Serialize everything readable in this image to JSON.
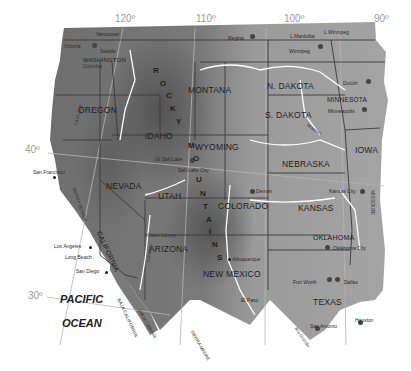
{
  "map": {
    "title": "Western United States relief map",
    "colors": {
      "land": "#8e8e8e",
      "relief_dark": "#555555",
      "water": "#ffffff",
      "border": "#3a3a3a",
      "graticule": "#b0b0b0"
    },
    "graticule": {
      "longitudes": [
        "120º",
        "110º",
        "100º",
        "90º"
      ],
      "latitudes": [
        "40º",
        "30º"
      ]
    },
    "states": {
      "washington": "WASHINGTON",
      "oregon": "OREGON",
      "idaho": "IDAHO",
      "montana": "MONTANA",
      "wyoming": "WYOMING",
      "n_dakota": "N. DAKOTA",
      "s_dakota": "S. DAKOTA",
      "minnesota": "MINNESOTA",
      "iowa": "IOWA",
      "nebraska": "NEBRASKA",
      "nevada": "NEVADA",
      "utah": "UTAH",
      "colorado": "COLORADO",
      "kansas": "KANSAS",
      "california": "CALIFORNIA",
      "arizona": "ARIZONA",
      "new_mexico": "NEW MEXICO",
      "oklahoma": "OKLAHOMA",
      "texas": "TEXAS",
      "baja": "BAJA CALIFORNIA"
    },
    "cities": {
      "vancouver": "Vancouver",
      "victoria": "Victoria",
      "seattle": "Seattle",
      "regina": "Regina",
      "winnipeg": "Winnipeg",
      "duluth": "Duluth",
      "minneapolis": "Minneapolis",
      "great_salt_lake": "Gt Salt Lake",
      "salt_lake_city": "Salt Lake City",
      "denver": "Denver",
      "kansas_city": "Kansas City",
      "san_francisco": "San Francisco",
      "los_angeles": "Los Angeles",
      "long_beach": "Long Beach",
      "san_diego": "San Diego",
      "albuquerque": "Albuquerque",
      "oklahoma_city": "Oklahoma City",
      "fort_worth": "Fort Worth",
      "dallas": "Dallas",
      "el_paso": "El Paso",
      "san_antonio": "San Antonio",
      "houston": "Houston"
    },
    "water": {
      "pacific": "PACIFIC",
      "ocean": "OCEAN",
      "l_manitoba": "L Manitoba",
      "l_winnipeg": "L Winnipeg",
      "gulf_of_california": "Gulf of California",
      "columbia": "Columbia",
      "missouri": "Missouri",
      "missouri_state": "MISSOURI",
      "colorado_river": "Colorado",
      "grand_canyon": "Grand Canyon",
      "rio_grande": "Rio Grande"
    },
    "ranges": {
      "rocky": [
        "R",
        "O",
        "C",
        "K",
        "Y"
      ],
      "mountains": [
        "M",
        "O",
        "U",
        "N",
        "T",
        "A",
        "I",
        "N",
        "S"
      ],
      "cascade": "CASCADE",
      "sierra_nevada": "SIERRA NEVADA",
      "sierra_madre": "SIERRA MADRE"
    }
  }
}
